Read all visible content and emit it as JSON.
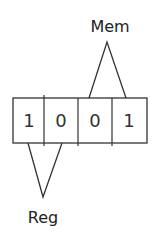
{
  "diagram": {
    "bits": [
      "1",
      "0",
      "0",
      "1"
    ],
    "labels": {
      "top": "Mem",
      "bottom": "Reg"
    },
    "groups": {
      "mem": {
        "label": "Mem",
        "covers_bits": [
          2,
          3
        ],
        "position": "above"
      },
      "reg": {
        "label": "Reg",
        "covers_bits": [
          0,
          1
        ],
        "position": "below"
      }
    },
    "colors": {
      "stroke": "#333333",
      "text": "#222222",
      "background": "#ffffff"
    }
  }
}
